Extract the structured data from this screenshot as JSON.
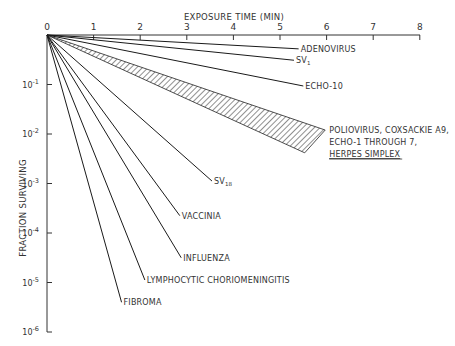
{
  "chart_data": {
    "type": "line",
    "title": "",
    "xlabel": "EXPOSURE TIME (MIN)",
    "ylabel": "FRACTION SURVIVING",
    "x_axis_position": "top",
    "xlim": [
      0,
      8
    ],
    "x_ticks": [
      "0",
      "1",
      "2",
      "3",
      "4",
      "5",
      "6",
      "7",
      "8"
    ],
    "y_scale": "log",
    "ylim": [
      1e-06,
      1
    ],
    "y_ticks": [
      {
        "value": 0.1,
        "base": "10",
        "exp": "-1"
      },
      {
        "value": 0.01,
        "base": "10",
        "exp": "-2"
      },
      {
        "value": 0.001,
        "base": "10",
        "exp": "-3"
      },
      {
        "value": 0.0001,
        "base": "10",
        "exp": "-4"
      },
      {
        "value": 1e-05,
        "base": "10",
        "exp": "-5"
      },
      {
        "value": 1e-06,
        "base": "10",
        "exp": "-6"
      }
    ],
    "grid": false,
    "legend": "direct labels at line ends",
    "series": [
      {
        "name": "ADENOVIRUS",
        "label": "ADENOVIRUS",
        "x": [
          0,
          5.4
        ],
        "log10_y": [
          0,
          -0.28
        ]
      },
      {
        "name": "SV1",
        "label": "SV",
        "sub": "1",
        "x": [
          0,
          5.3
        ],
        "log10_y": [
          0,
          -0.51
        ]
      },
      {
        "name": "ECHO-10",
        "label": "ECHO-10",
        "x": [
          0,
          5.5
        ],
        "log10_y": [
          0,
          -1.03
        ]
      },
      {
        "name": "POLIOVIRUS, COXSACKIE A9, ECHO-1 THROUGH 7, HERPES SIMPLEX",
        "label_lines": [
          "POLIOVIRUS, COXSACKIE A9,",
          "ECHO-1 THROUGH 7,"
        ],
        "label_underlined": "HERPES SIMPLEX",
        "band": true,
        "x": [
          0,
          5.97
        ],
        "log10_y_upper": [
          0,
          -1.92
        ],
        "log10_y_lower_x": [
          0,
          5.53
        ],
        "log10_y_lower": [
          0,
          -2.38
        ]
      },
      {
        "name": "SV18",
        "label": "SV",
        "sub": "18",
        "x": [
          0,
          3.54
        ],
        "log10_y": [
          0,
          -2.95
        ]
      },
      {
        "name": "VACCINIA",
        "label": "VACCINIA",
        "x": [
          0,
          2.85
        ],
        "log10_y": [
          0,
          -3.65
        ]
      },
      {
        "name": "INFLUENZA",
        "label": "INFLUENZA",
        "x": [
          0,
          2.88
        ],
        "log10_y": [
          0,
          -4.5
        ]
      },
      {
        "name": "LYMPHOCYTIC CHORIOMENINGITIS",
        "label": "LYMPHOCYTIC CHORIOMENINGITIS",
        "x": [
          0,
          2.1
        ],
        "log10_y": [
          0,
          -4.95
        ]
      },
      {
        "name": "FIBROMA",
        "label": "FIBROMA",
        "x": [
          0,
          1.6
        ],
        "log10_y": [
          0,
          -5.4
        ]
      }
    ]
  },
  "colors": {
    "line": "#1a1a1a",
    "text": "#333333",
    "background": "#ffffff"
  }
}
